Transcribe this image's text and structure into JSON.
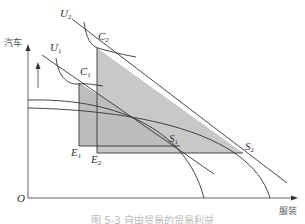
{
  "figure": {
    "caption": "图 5-3 自由贸易的贸易利益",
    "axes": {
      "y_label": "汽车",
      "x_label": "服装",
      "origin_label": "O"
    },
    "points": {
      "U1": {
        "base": "U",
        "sub": "1"
      },
      "U2": {
        "base": "U",
        "sub": "2"
      },
      "C1": {
        "base": "C",
        "sub": "1"
      },
      "C2": {
        "base": "C",
        "sub": "2"
      },
      "E1": {
        "base": "E",
        "sub": "1"
      },
      "E2": {
        "base": "E",
        "sub": "2"
      },
      "S1": {
        "base": "S",
        "sub": "1"
      },
      "S2": {
        "base": "S",
        "sub": "2"
      }
    },
    "colors": {
      "line": "#333333",
      "shade": "#c8c8c8",
      "axis": "#555555"
    }
  }
}
